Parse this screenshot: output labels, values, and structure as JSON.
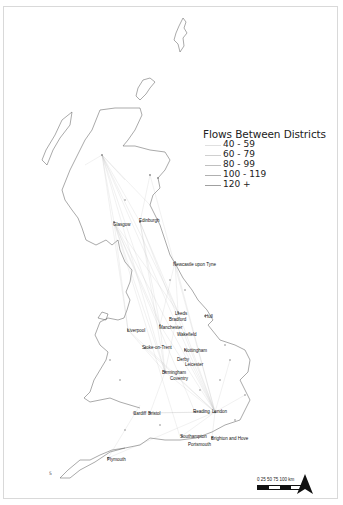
{
  "legend": {
    "title": "Flows Between Districts",
    "items": [
      {
        "label": "40 - 59",
        "weight": 0.4,
        "color": "#dddddd"
      },
      {
        "label": "60 - 79",
        "weight": 0.6,
        "color": "#cccccc"
      },
      {
        "label": "80 - 99",
        "weight": 0.8,
        "color": "#bbbbbb"
      },
      {
        "label": "100 - 119",
        "weight": 1.0,
        "color": "#aaaaaa"
      },
      {
        "label": "120 +",
        "weight": 1.2,
        "color": "#999999"
      }
    ]
  },
  "cities": [
    {
      "name": "Glasgow",
      "x": 113,
      "y": 222
    },
    {
      "name": "Edinburgh",
      "x": 139,
      "y": 218
    },
    {
      "name": "Newcastle upon Tyne",
      "x": 173,
      "y": 262
    },
    {
      "name": "Leeds",
      "x": 175,
      "y": 311
    },
    {
      "name": "Bradford",
      "x": 169,
      "y": 317
    },
    {
      "name": "Hull",
      "x": 205,
      "y": 314
    },
    {
      "name": "Liverpool",
      "x": 127,
      "y": 328
    },
    {
      "name": "Manchester",
      "x": 159,
      "y": 325
    },
    {
      "name": "Wakefield",
      "x": 177,
      "y": 332
    },
    {
      "name": "Stoke-on-Trent",
      "x": 142,
      "y": 345
    },
    {
      "name": "Nottingham",
      "x": 184,
      "y": 348
    },
    {
      "name": "Derby",
      "x": 177,
      "y": 357
    },
    {
      "name": "Leicester",
      "x": 185,
      "y": 362
    },
    {
      "name": "Birmingham",
      "x": 162,
      "y": 370
    },
    {
      "name": "Coventry",
      "x": 170,
      "y": 376
    },
    {
      "name": "Cardiff",
      "x": 133,
      "y": 411
    },
    {
      "name": "Bristol",
      "x": 148,
      "y": 411
    },
    {
      "name": "Reading",
      "x": 193,
      "y": 409
    },
    {
      "name": "London",
      "x": 212,
      "y": 409
    },
    {
      "name": "Southampton",
      "x": 180,
      "y": 434
    },
    {
      "name": "Brighton and Hove",
      "x": 211,
      "y": 436
    },
    {
      "name": "Portsmouth",
      "x": 188,
      "y": 442
    },
    {
      "name": "Plymouth",
      "x": 107,
      "y": 457
    }
  ],
  "scalebar": {
    "ticks": "0   25   50   75   100 km"
  },
  "north_arrow": "north-arrow",
  "misc_label": "5"
}
